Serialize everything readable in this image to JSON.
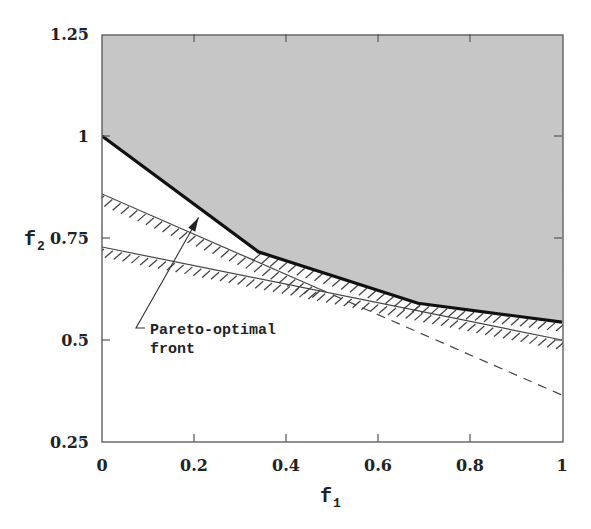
{
  "chart_data": {
    "type": "line",
    "title": "",
    "xlabel": "f1",
    "ylabel": "f2",
    "xlabel_main": "f",
    "xlabel_sub": "1",
    "ylabel_main": "f",
    "ylabel_sub": "2",
    "xlim": [
      0,
      1
    ],
    "ylim": [
      0.25,
      1.25
    ],
    "grid": false,
    "legend": null,
    "x_ticks": [
      0,
      0.2,
      0.4,
      0.6,
      0.8,
      1
    ],
    "x_tick_labels": [
      "0",
      "0.2",
      "0.4",
      "0.6",
      "0.8",
      "1"
    ],
    "y_ticks": [
      0.25,
      0.5,
      0.75,
      1,
      1.25
    ],
    "y_tick_labels": [
      "0.25",
      "0.5",
      "0.75",
      "1",
      "1.25"
    ],
    "series": [
      {
        "name": "Pareto-optimal front",
        "style": "thick solid",
        "x": [
          0,
          0.34,
          0.687,
          1
        ],
        "y": [
          1.0,
          0.716,
          0.59,
          0.544
        ]
      },
      {
        "name": "Constraint line 1 (hatched, feasible above)",
        "style": "solid with hatching, then dashed",
        "x": [
          0,
          1
        ],
        "y": [
          0.858,
          0.365
        ],
        "hatched_until_x": 0.47
      },
      {
        "name": "Constraint line 2 (hatched, feasible above)",
        "style": "solid with hatching",
        "x": [
          0,
          1
        ],
        "y": [
          0.728,
          0.5
        ]
      }
    ],
    "shaded_region": {
      "description": "Feasible objective region above the Pareto-optimal front",
      "color": "#c6c6c6"
    },
    "annotations": [
      {
        "text_lines": [
          "Pareto-optimal",
          "front"
        ],
        "arrow_to": [
          0.21,
          0.8
        ]
      }
    ]
  },
  "colors": {
    "shade": "#c6c6c6",
    "line": "#111111",
    "axis": "#555555",
    "hatch": "#444444"
  }
}
